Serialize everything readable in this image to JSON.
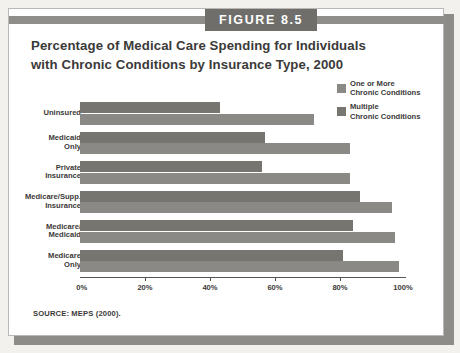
{
  "figure": {
    "label": "FIGURE 8.5",
    "title": "Percentage of Medical Care Spending for Individuals with Chronic Conditions by Insurance Type, 2000",
    "source_note": "SOURCE: MEPS (2000)."
  },
  "colors": {
    "page_background": "#f2f1ee",
    "card_background": "#ffffff",
    "header_band": "#8f8e8a",
    "figure_tag_background": "#6f6e6b",
    "figure_tag_text": "#ffffff",
    "series_one_or_more": "#8a8985",
    "series_multiple": "#76756f",
    "axis": "#55544f",
    "text": "#3b3a38"
  },
  "chart_data": {
    "type": "bar",
    "orientation": "horizontal",
    "title": "Percentage of Medical Care Spending for Individuals with Chronic Conditions by Insurance Type, 2000",
    "xlabel": "",
    "ylabel": "",
    "xlim": [
      0,
      100
    ],
    "xticks": [
      0,
      20,
      40,
      60,
      80,
      100
    ],
    "xtick_labels": [
      "0%",
      "20%",
      "40%",
      "60%",
      "80%",
      "100%"
    ],
    "grid": false,
    "legend_position": "top-right",
    "categories": [
      "Uninsured",
      "Medicaid\nOnly",
      "Private\nInsurance",
      "Medicare/Supp.\nInsurance",
      "Medicare/\nMedicaid",
      "Medicare\nOnly"
    ],
    "series": [
      {
        "name": "Multiple\nChronic Conditions",
        "legend_label": "Multiple\nChronic Conditions",
        "color": "#76756f",
        "values": [
          43,
          57,
          56,
          86,
          84,
          81
        ]
      },
      {
        "name": "One or More\nChronic Conditions",
        "legend_label": "One or More\nChronic Conditions",
        "color": "#8a8985",
        "values": [
          72,
          83,
          83,
          96,
          97,
          98
        ]
      }
    ],
    "legend": [
      {
        "label": "One or More\nChronic Conditions",
        "color": "#8a8985"
      },
      {
        "label": "Multiple\nChronic Conditions",
        "color": "#76756f"
      }
    ]
  }
}
